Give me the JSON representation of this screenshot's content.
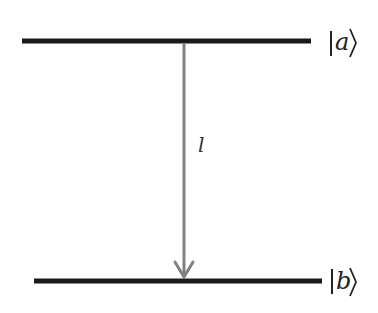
{
  "diagram": {
    "type": "energy-level-transition",
    "levels": [
      {
        "id": "a",
        "label": "|a⟩",
        "bar": "|",
        "symbol": "a",
        "close": "⟩",
        "y": 41,
        "x1": 22,
        "x2": 311
      },
      {
        "id": "b",
        "label": "|b⟩",
        "bar": "|",
        "symbol": "b",
        "close": "⟩",
        "y": 281,
        "x1": 34,
        "x2": 322
      }
    ],
    "transition": {
      "from": "a",
      "to": "b",
      "label": "l",
      "direction": "down"
    },
    "colors": {
      "level": "#1a1a1a",
      "arrow": "#808080",
      "text": "#222222"
    }
  }
}
